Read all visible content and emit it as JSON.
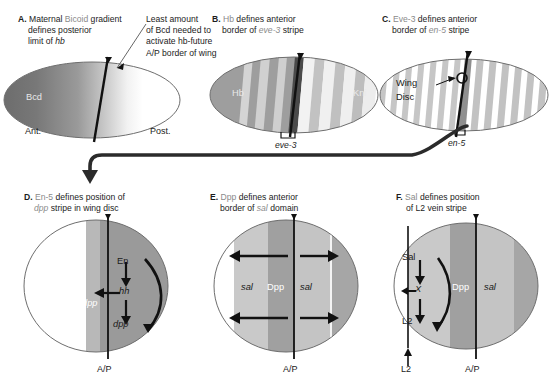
{
  "panels": [
    {
      "id": "A",
      "letter": "A.",
      "caption_line1_pre": "Maternal ",
      "caption_gene": "Bicoid",
      "caption_line1_post": " gradient",
      "caption_line2": "defines posterior",
      "caption_line3_pre": "limit of ",
      "caption_line3_gene": "hb",
      "labels": {
        "gradient": "Bcd",
        "anterior": "Ant.",
        "posterior": "Post."
      }
    },
    {
      "id": "B",
      "letter": "B.",
      "caption_line1_gene": "Hb",
      "caption_line1_post": " defines anterior",
      "caption_line2_pre": "border of ",
      "caption_line2_gene": "eve-3",
      "caption_line2_post": " stripe",
      "labels": {
        "left_domain": "Hb",
        "right_domain": "Kni",
        "bracket": "eve-3"
      }
    },
    {
      "id": "C",
      "letter": "C.",
      "caption_line1_gene": "Eve-3",
      "caption_line1_post": " defines anterior",
      "caption_line2_pre": "border of ",
      "caption_line2_gene": "en-5",
      "caption_line2_post": " stripe",
      "labels": {
        "pointer_line1": "Wing",
        "pointer_line2": "Disc",
        "bracket": "en-5"
      }
    },
    {
      "id": "D",
      "letter": "D.",
      "caption_line1_gene": "En-5",
      "caption_line1_post": " defines position of",
      "caption_line2_gene": "dpp",
      "caption_line2_post": " stripe in wing disc",
      "labels": {
        "stripe": "dpp",
        "cascade_top": "En",
        "cascade_mid": "hh",
        "cascade_bottom": "dpp",
        "axis": "A/P"
      }
    },
    {
      "id": "E",
      "letter": "E.",
      "caption_line1_gene": "Dpp",
      "caption_line1_post": " defines anterior",
      "caption_line2_pre": "border of ",
      "caption_line2_gene": "sal",
      "caption_line2_post": " domain",
      "labels": {
        "sal_left": "sal",
        "dpp": "Dpp",
        "sal_right": "sal",
        "axis": "A/P"
      }
    },
    {
      "id": "F",
      "letter": "F.",
      "caption_line1_gene": "Sal",
      "caption_line1_post": " defines position",
      "caption_line2": "of L2 vein stripe",
      "labels": {
        "cascade_top": "Sal",
        "cascade_mid": "X",
        "cascade_bottom": "L2",
        "dpp": "Dpp",
        "sal": "sal",
        "vein": "L2",
        "axis": "A/P"
      }
    }
  ],
  "annotation": {
    "line1": "Least amount",
    "line2": "of Bcd needed to",
    "line3": "activate hb-future",
    "line4": "A/P border of wing"
  },
  "colors": {
    "ink": "#1a1a1a",
    "caption_gene_grey": "#8a8a8a",
    "outline": "#6e6e6e",
    "bcd_dark": "#6d6d6d",
    "hb_grey": "#9e9e9e",
    "stripe_light": "#d8d8d8",
    "stripe_mid": "#b4b4b4",
    "stripe_dark": "#4a4a4a",
    "disc_posterior": "#9a9a9a",
    "disc_dpp": "#b8b8b8",
    "sal_light": "#c9c9c9",
    "dpp_band": "#a0a0a0",
    "white": "#ffffff"
  }
}
